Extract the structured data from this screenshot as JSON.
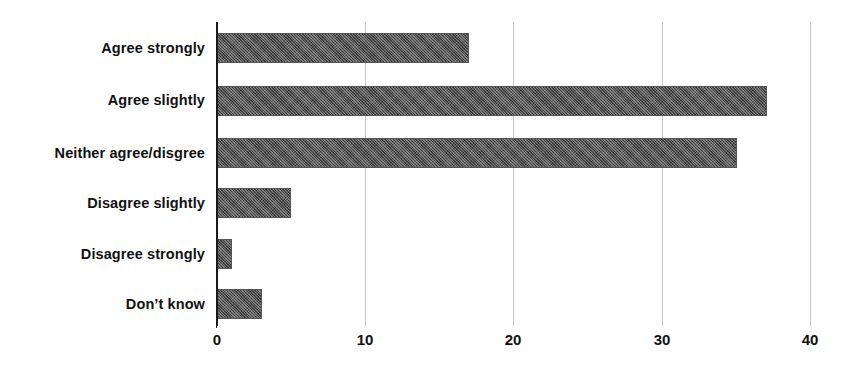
{
  "chart_data": {
    "type": "bar",
    "orientation": "horizontal",
    "title": "",
    "subtitle": "",
    "xlabel": "",
    "ylabel": "",
    "categories": [
      "Agree strongly",
      "Agree slightly",
      "Neither agree/disgree",
      "Disagree slightly",
      "Disagree strongly",
      "Don’t know"
    ],
    "values": [
      17,
      37,
      35,
      5,
      1,
      3
    ],
    "xlim": [
      0,
      40
    ],
    "ylim": null,
    "xticks": [
      0,
      10,
      20,
      30,
      40
    ],
    "xtick_labels": [
      "0",
      "10",
      "20",
      "30",
      "40"
    ],
    "grid": true,
    "grid_axis": "x",
    "legend": false,
    "legend_position": "none",
    "annotations": [],
    "series": [
      {
        "name": "",
        "values": [
          17,
          37,
          35,
          5,
          1,
          3
        ]
      }
    ]
  },
  "style": {
    "background_color": "#ffffff",
    "bar_color": "#4f4f4f",
    "bar_pattern": "cross-hatch",
    "grid_color": "#c9c9c9",
    "axis_color": "#1a1a1a",
    "text_color": "#111111"
  }
}
